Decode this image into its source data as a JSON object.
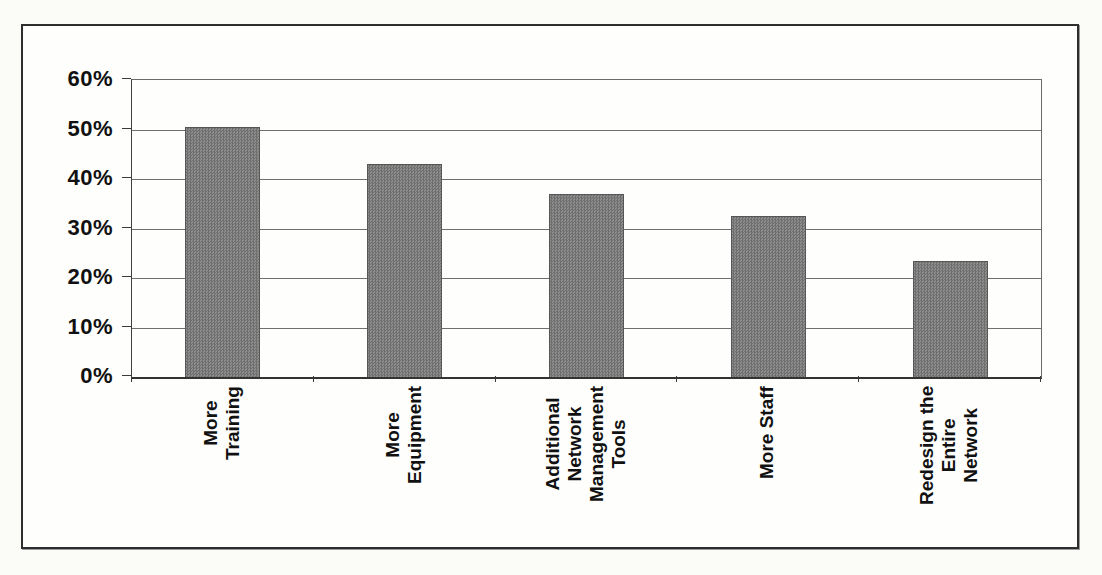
{
  "figure": {
    "background_color": "#fbfbf8",
    "frame_color": "#2e2e2e",
    "plot_background": "#fefefc"
  },
  "chart_data": {
    "type": "bar",
    "title": "",
    "xlabel": "",
    "ylabel": "",
    "categories": [
      "More\nTraining",
      "More\nEquipment",
      "Additional\nNetwork\nManagement\nTools",
      "More Staff",
      "Redesign the\nEntire\nNetwork"
    ],
    "values": [
      50.5,
      43,
      37,
      32.5,
      23.5
    ],
    "ylim": [
      0,
      60
    ],
    "y_ticks": [
      "0%",
      "10%",
      "20%",
      "30%",
      "40%",
      "50%",
      "60%"
    ],
    "y_tick_step": 10,
    "grid": "horizontal gridlines on",
    "legend": "none",
    "label_rotation_degrees": 90,
    "bar_color": "#7e7e7e",
    "bar_texture": "halftone-checker",
    "bar_border_color": "#565656",
    "gridline_color": "#6f6f6f",
    "axis_color": "#333333",
    "tick_label_color": "#111111"
  }
}
